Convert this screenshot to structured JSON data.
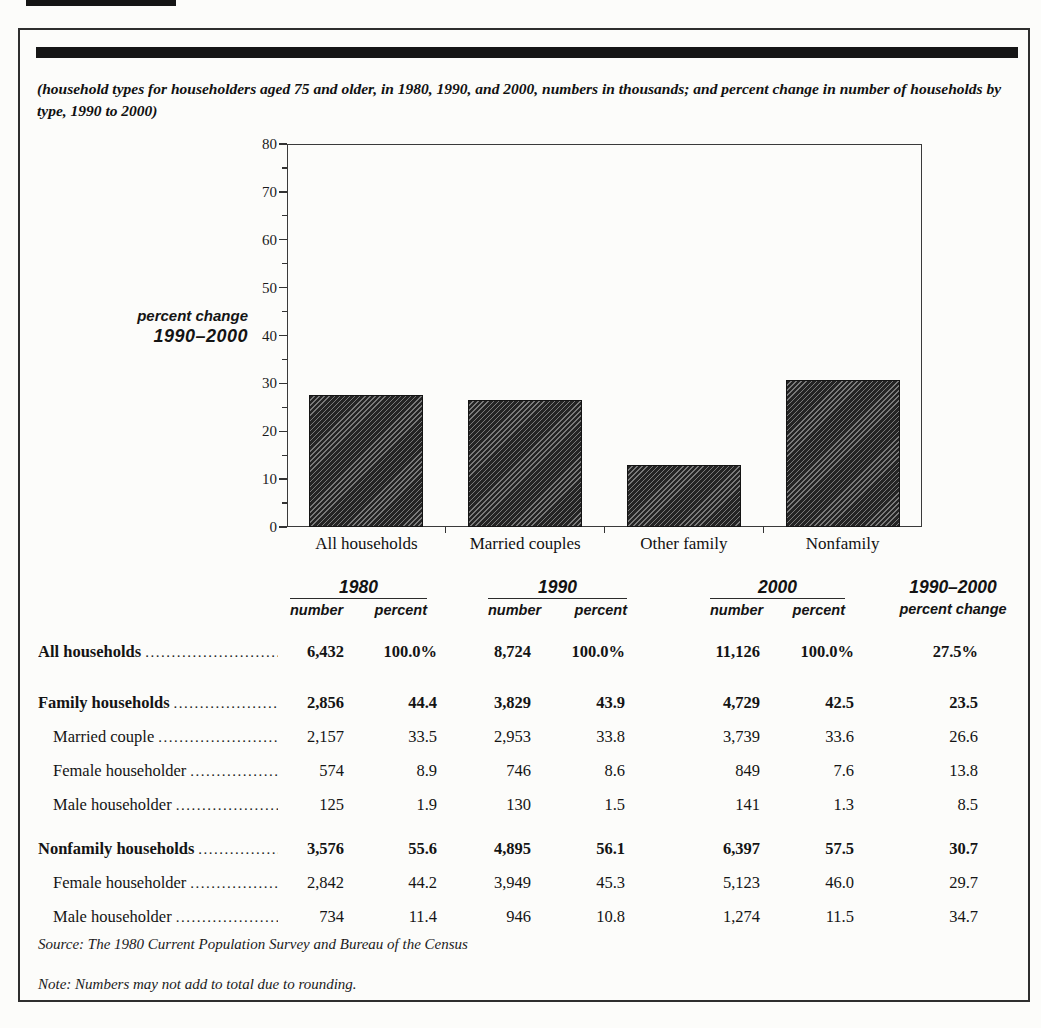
{
  "page": {
    "caption": "(household types for householders aged 75 and older, in 1980, 1990, and 2000, numbers in thousands; and percent change in number of households by type, 1990 to 2000)",
    "source": "Source: The 1980 Current Population Survey and Bureau of the Census",
    "note": "Note: Numbers may not add to total due to rounding."
  },
  "chart_data": {
    "type": "bar",
    "title": "",
    "ylabel_line1": "percent change",
    "ylabel_line2": "1990–2000",
    "categories": [
      "All households",
      "Married couples",
      "Other family",
      "Nonfamily"
    ],
    "values": [
      27.5,
      26.6,
      13.0,
      30.7
    ],
    "ylim": [
      0,
      80
    ],
    "ytick_step": 10,
    "yticks": [
      0,
      10,
      20,
      30,
      40,
      50,
      60,
      70,
      80
    ],
    "minor_tick_step": 5,
    "grid": false,
    "legend": "none",
    "bar_color": "#242424",
    "hatch_color": "#7a7a7a"
  },
  "table": {
    "groups": [
      {
        "year": "1980",
        "subs": [
          "number",
          "percent"
        ],
        "underline": true
      },
      {
        "year": "1990",
        "subs": [
          "number",
          "percent"
        ],
        "underline": true
      },
      {
        "year": "2000",
        "subs": [
          "number",
          "percent"
        ],
        "underline": true
      },
      {
        "year": "1990–2000",
        "subs": [
          "percent change"
        ],
        "underline": false
      }
    ],
    "rows": [
      {
        "label": "All households",
        "bold": true,
        "indent": false,
        "gap": 12,
        "values": [
          "6,432",
          "100.0%",
          "8,724",
          "100.0%",
          "11,126",
          "100.0%",
          "27.5%"
        ]
      },
      {
        "label": "Family households",
        "bold": true,
        "indent": false,
        "gap": 17,
        "values": [
          "2,856",
          "44.4",
          "3,829",
          "43.9",
          "4,729",
          "42.5",
          "23.5"
        ]
      },
      {
        "label": "Married couple",
        "bold": false,
        "indent": true,
        "gap": 0,
        "values": [
          "2,157",
          "33.5",
          "2,953",
          "33.8",
          "3,739",
          "33.6",
          "26.6"
        ]
      },
      {
        "label": "Female householder",
        "bold": false,
        "indent": true,
        "gap": 0,
        "values": [
          "574",
          "8.9",
          "746",
          "8.6",
          "849",
          "7.6",
          "13.8"
        ]
      },
      {
        "label": "Male householder",
        "bold": false,
        "indent": true,
        "gap": 0,
        "values": [
          "125",
          "1.9",
          "130",
          "1.5",
          "141",
          "1.3",
          "8.5"
        ]
      },
      {
        "label": "Nonfamily households",
        "bold": true,
        "indent": false,
        "gap": 10,
        "values": [
          "3,576",
          "55.6",
          "4,895",
          "56.1",
          "6,397",
          "57.5",
          "30.7"
        ]
      },
      {
        "label": "Female householder",
        "bold": false,
        "indent": true,
        "gap": 0,
        "values": [
          "2,842",
          "44.2",
          "3,949",
          "45.3",
          "5,123",
          "46.0",
          "29.7"
        ]
      },
      {
        "label": "Male householder",
        "bold": false,
        "indent": true,
        "gap": 0,
        "values": [
          "734",
          "11.4",
          "946",
          "10.8",
          "1,274",
          "11.5",
          "34.7"
        ]
      }
    ]
  }
}
